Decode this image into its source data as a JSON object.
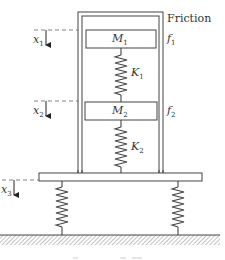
{
  "diagram": {
    "type": "mass-spring-friction system",
    "colors": {
      "line": "#444444",
      "hatch": "#888888",
      "background": "#ffffff",
      "text": "#333333"
    },
    "labels": {
      "friction": "Friction",
      "m1": "M",
      "m1_sub": "1",
      "m2": "M",
      "m2_sub": "2",
      "k1": "K",
      "k1_sub": "1",
      "k2": "K",
      "k2_sub": "2",
      "f1": "f",
      "f1_sub": "1",
      "f2": "f",
      "f2_sub": "2",
      "x1": "x",
      "x1_sub": "1",
      "x2": "x",
      "x2_sub": "2",
      "x3": "x",
      "x3_sub": "3"
    },
    "components": [
      {
        "id": "frame",
        "kind": "double-wall housing"
      },
      {
        "id": "M1",
        "kind": "mass",
        "friction": "f1"
      },
      {
        "id": "K1",
        "kind": "spring",
        "connects": [
          "M1",
          "M2"
        ]
      },
      {
        "id": "M2",
        "kind": "mass",
        "friction": "f2"
      },
      {
        "id": "K2",
        "kind": "spring",
        "connects": [
          "M2",
          "base"
        ]
      },
      {
        "id": "base",
        "kind": "platform",
        "displacement": "x3"
      },
      {
        "id": "support-springs",
        "kind": "spring pair",
        "connects": [
          "base",
          "ground"
        ]
      },
      {
        "id": "ground",
        "kind": "hatched ground"
      }
    ]
  }
}
